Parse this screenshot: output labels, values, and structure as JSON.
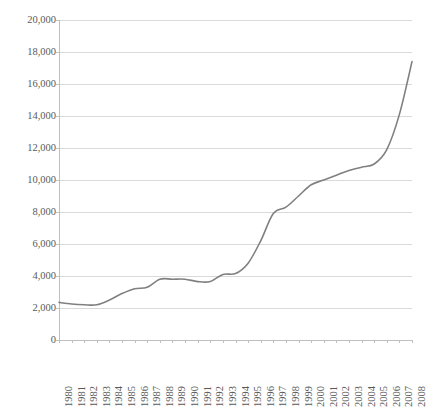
{
  "chart_data": {
    "type": "line",
    "title": "",
    "subtitle": "",
    "xlabel": "",
    "ylabel": "",
    "grid": true,
    "legend": false,
    "legend_position": "none",
    "line_color": "#808080",
    "gridline_color": "#d9d9d9",
    "axis_color": "#bfbfbf",
    "text_color": "#595959",
    "xlim": [
      1980,
      2008
    ],
    "ylim": [
      0,
      20000
    ],
    "ytick_labels": [
      "20,000",
      "18,000",
      "16,000",
      "14,000",
      "12,000",
      "10,000",
      "8,000",
      "6,000",
      "4,000",
      "2,000",
      "0"
    ],
    "ytick_values": [
      20000,
      18000,
      16000,
      14000,
      12000,
      10000,
      8000,
      6000,
      4000,
      2000,
      0
    ],
    "categories": [
      "1980",
      "1981",
      "1982",
      "1983",
      "1984",
      "1985",
      "1986",
      "1987",
      "1988",
      "1989",
      "1990",
      "1991",
      "1992",
      "1993",
      "1994",
      "1995",
      "1996",
      "1997",
      "1998",
      "1999",
      "2000",
      "2001",
      "2002",
      "2003",
      "2004",
      "2005",
      "2006",
      "2007",
      "2008"
    ],
    "values": [
      2350,
      2250,
      2200,
      2200,
      2500,
      2900,
      3200,
      3300,
      3800,
      3800,
      3800,
      3650,
      3650,
      4100,
      4150,
      4800,
      6200,
      7900,
      8300,
      9000,
      9700,
      10000,
      10300,
      10600,
      10800,
      11000,
      11900,
      14100,
      17400
    ]
  }
}
